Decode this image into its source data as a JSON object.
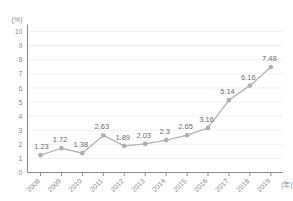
{
  "chart_data": {
    "type": "line",
    "title": "",
    "subtitle": "",
    "xlabel": "(年)",
    "ylabel": "(%)",
    "categories": [
      "2008",
      "2009",
      "2010",
      "2011",
      "2012",
      "2013",
      "2014",
      "2015",
      "2016",
      "2017",
      "2018",
      "2019"
    ],
    "values": [
      1.23,
      1.72,
      1.38,
      2.63,
      1.89,
      2.03,
      2.3,
      2.65,
      3.16,
      5.14,
      6.16,
      7.48
    ],
    "point_labels": [
      "1.23",
      "1.72",
      "1.38",
      "2.63",
      "1.89",
      "2.03",
      "2.3",
      "2.65",
      "3.16",
      "5.14",
      "6.16",
      "7.48"
    ],
    "ylim": [
      0,
      10
    ],
    "yticks": [
      "0",
      "1",
      "2",
      "3",
      "4",
      "5",
      "6",
      "7",
      "8",
      "9",
      "10"
    ],
    "grid": true,
    "grid_axis": "y",
    "legend": false,
    "legend_position": "none",
    "series": [
      {
        "name": "",
        "values": [
          1.23,
          1.72,
          1.38,
          2.63,
          1.89,
          2.03,
          2.3,
          2.65,
          3.16,
          5.14,
          6.16,
          7.48
        ]
      }
    ]
  },
  "style": {
    "line_color": "#b3b3b3",
    "marker_color": "#b0b0b0",
    "axis_color": "#8c8c8c",
    "grid_color": "#f0f0f0",
    "label_color": "#6d6d6d",
    "tick_color": "#8a8a8a",
    "background": "#ffffff"
  }
}
